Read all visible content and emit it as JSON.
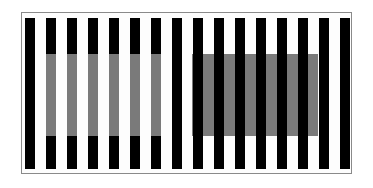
{
  "figure": {
    "type": "whites-illusion",
    "frame": {
      "x": 21,
      "y": 12,
      "w": 331,
      "h": 162,
      "border_color": "#8a8a8a"
    },
    "bars": {
      "count": 16,
      "first_x": 25,
      "pitch": 21,
      "width": 10,
      "top": 18,
      "bottom": 169,
      "color": "#000000"
    },
    "gray_band": {
      "top": 54,
      "bottom": 136,
      "color": "#7a7a7a"
    },
    "left_patch": {
      "description": "gray replaces black on bars",
      "bar_indices": [
        1,
        2,
        3,
        4,
        5,
        6
      ]
    },
    "right_patch": {
      "description": "gray fills white gaps behind bars",
      "x_start": 192,
      "x_end": 318
    }
  }
}
